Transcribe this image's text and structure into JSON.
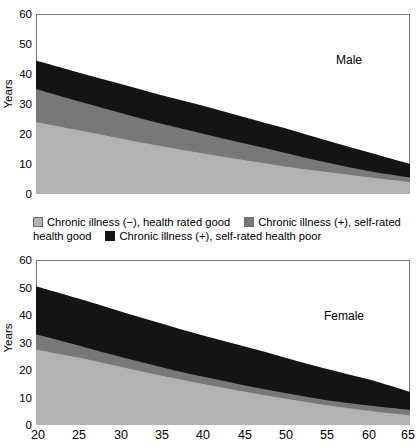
{
  "chart_data": {
    "type": "area",
    "title": "",
    "xlabel": "",
    "ylabel": "Years",
    "xlim": [
      20,
      65
    ],
    "ylim": [
      0,
      60
    ],
    "grid": false,
    "stacked": true,
    "legend_position": "between-panels",
    "xticks": [
      "20",
      "25",
      "30",
      "35",
      "40",
      "45",
      "50",
      "55",
      "60",
      "65"
    ],
    "yticks": [
      "0",
      "10",
      "20",
      "30",
      "40",
      "50",
      "60"
    ],
    "panels": [
      {
        "name": "Male",
        "annotation": "Male",
        "x": [
          20,
          25,
          30,
          35,
          40,
          45,
          50,
          55,
          60,
          65
        ],
        "series": [
          {
            "name": "Chronic illness (−), health rated good",
            "color": "#b2b2b2",
            "values": [
              24.0,
              21.3,
              18.6,
              16.0,
              13.6,
              11.3,
              9.2,
              7.3,
              5.6,
              4.0
            ]
          },
          {
            "name": "Chronic illness (+), self-rated health good",
            "color": "#787878",
            "values": [
              11.0,
              9.7,
              8.6,
              7.5,
              6.6,
              5.6,
              4.5,
              3.2,
              2.1,
              1.5
            ]
          },
          {
            "name": "Chronic illness (+), self-rated health poor",
            "color": "#141414",
            "values": [
              9.5,
              9.6,
              9.6,
              9.5,
              9.3,
              8.8,
              8.2,
              7.3,
              6.2,
              4.5
            ]
          }
        ],
        "cumulative_tops": {
          "layer1": [
            24.0,
            21.3,
            18.6,
            16.0,
            13.6,
            11.3,
            9.2,
            7.3,
            5.6,
            4.0
          ],
          "layer2": [
            35.0,
            31.0,
            27.2,
            23.5,
            20.2,
            16.9,
            13.7,
            10.5,
            7.7,
            5.5
          ],
          "layer3": [
            44.5,
            40.6,
            36.8,
            33.0,
            29.5,
            25.7,
            21.9,
            17.8,
            13.9,
            10.0
          ]
        }
      },
      {
        "name": "Female",
        "annotation": "Female",
        "x": [
          20,
          25,
          30,
          35,
          40,
          45,
          50,
          55,
          60,
          65
        ],
        "series": [
          {
            "name": "Chronic illness (−), health rated good",
            "color": "#b2b2b2",
            "values": [
              27.5,
              24.6,
              21.3,
              18.0,
              15.0,
              12.2,
              9.6,
              7.2,
              5.2,
              3.5
            ]
          },
          {
            "name": "Chronic illness (+), self-rated health good",
            "color": "#787878",
            "values": [
              5.5,
              4.4,
              3.6,
              3.1,
              2.6,
              2.3,
              2.0,
              1.8,
              1.9,
              2.0
            ]
          },
          {
            "name": "Chronic illness (+), self-rated health poor",
            "color": "#141414",
            "values": [
              17.5,
              17.1,
              16.6,
              15.9,
              15.0,
              14.1,
              12.9,
              11.4,
              9.5,
              6.5
            ]
          }
        ],
        "cumulative_tops": {
          "layer1": [
            27.5,
            24.6,
            21.3,
            18.0,
            15.0,
            12.2,
            9.6,
            7.2,
            5.2,
            3.5
          ],
          "layer2": [
            33.0,
            29.0,
            24.9,
            21.1,
            17.6,
            14.5,
            11.6,
            9.0,
            7.1,
            5.5
          ],
          "layer3": [
            50.5,
            46.1,
            41.5,
            37.0,
            32.6,
            28.6,
            24.5,
            20.4,
            16.6,
            12.0
          ]
        }
      }
    ],
    "legend": [
      {
        "label": "Chronic illness (−), health rated good",
        "color": "#b2b2b2"
      },
      {
        "label": "Chronic illness (+), self-rated health good",
        "color": "#787878"
      },
      {
        "label": "Chronic illness (+), self-rated health poor",
        "color": "#141414"
      }
    ],
    "legend_lines": [
      {
        "parts": [
          {
            "swatch": "#b2b2b2",
            "text": "Chronic illness (−), health rated good"
          },
          {
            "swatch": "#787878",
            "text": "Chronic illness (+), self-rated"
          }
        ]
      },
      {
        "parts": [
          {
            "text": "health good"
          },
          {
            "swatch": "#141414",
            "text": "Chronic illness (+), self-rated health poor"
          }
        ]
      }
    ]
  },
  "legend": {
    "line1_item1_label": "Chronic illness (−), health rated good",
    "line1_item2_label": "Chronic illness (+), self-rated",
    "line2_item1_label": "health good",
    "line2_item2_label": "Chronic illness (+), self-rated health poor"
  },
  "male_panel": {
    "annotation": "Male",
    "ylabel": "Years",
    "yticks": {
      "t0": "0",
      "t1": "10",
      "t2": "20",
      "t3": "30",
      "t4": "40",
      "t5": "50",
      "t6": "60"
    }
  },
  "female_panel": {
    "annotation": "Female",
    "ylabel": "Years",
    "yticks": {
      "t0": "0",
      "t1": "10",
      "t2": "20",
      "t3": "30",
      "t4": "40",
      "t5": "50",
      "t6": "60"
    }
  },
  "xaxis": {
    "t0": "20",
    "t1": "25",
    "t2": "30",
    "t3": "35",
    "t4": "40",
    "t5": "45",
    "t6": "50",
    "t7": "55",
    "t8": "60",
    "t9": "65"
  },
  "colors": {
    "layer_light": "#b2b2b2",
    "layer_mid": "#787878",
    "layer_dark": "#141414",
    "frame": "#7a7a7a",
    "background": "#ffffff"
  }
}
